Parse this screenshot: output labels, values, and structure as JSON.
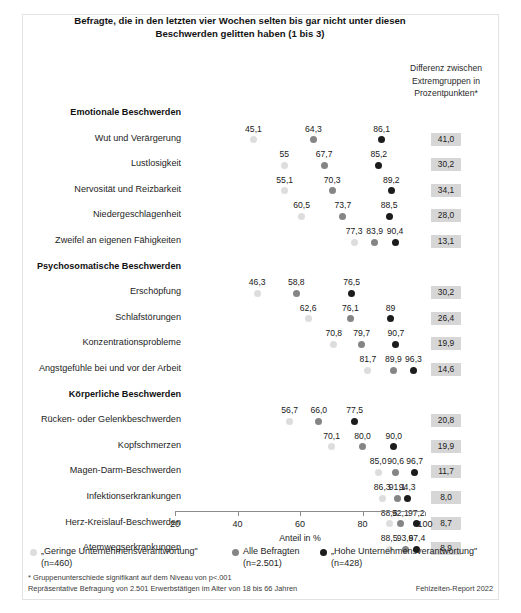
{
  "title": "Befragte, die in den letzten vier Wochen selten bis gar nicht unter diesen Beschwerden gelitten haben (1 bis 3)",
  "diff_column_header": "Differenz zwischen Extremgruppen in Prozentpunkten*",
  "footnotes": {
    "line1": "* Gruppenunterschiede signifikant auf dem Niveau von p<.001",
    "line2": "Repräsentative Befragung von 2.501 Erwerbstätigen im Alter von 18 bis 66 Jahren",
    "source": "Fehlzeiten-Report 2022"
  },
  "legend": {
    "items": [
      {
        "label": "„Geringe Unternehmensverantwortung\"",
        "sub": "(n=460)",
        "color": "#dddddd",
        "class": "low"
      },
      {
        "label": "Alle Befragten",
        "sub": "(n=2.501)",
        "color": "#858585",
        "class": "mid"
      },
      {
        "label": "„Hohe Unternehmensverantwortung\"",
        "sub": "(n=428)",
        "color": "#1c1c1c",
        "class": "high"
      }
    ]
  },
  "chart_data": {
    "type": "scatter",
    "title": "Befragte, die in den letzten vier Wochen selten bis gar nicht unter diesen Beschwerden gelitten haben (1 bis 3)",
    "xlabel": "Anteil in %",
    "ylabel": "",
    "xlim": [
      20,
      100
    ],
    "xticks": [
      20,
      40,
      60,
      80,
      100
    ],
    "grid": false,
    "legend_position": "bottom",
    "series": [
      {
        "name": "„Geringe Unternehmensverantwortung\" (n=460)",
        "color": "#dddddd"
      },
      {
        "name": "Alle Befragten (n=2.501)",
        "color": "#858585"
      },
      {
        "name": "„Hohe Unternehmensverantwortung\" (n=428)",
        "color": "#1c1c1c"
      }
    ],
    "sections": [
      {
        "header": "Emotionale Beschwerden",
        "rows": [
          {
            "label": "Wut und Verärgerung",
            "low": 45.1,
            "mid": 64.3,
            "high": 86.1,
            "low_text": "45,1",
            "mid_text": "64,3",
            "high_text": "86,1",
            "diff": "41,0"
          },
          {
            "label": "Lustlosigkeit",
            "low": 55.0,
            "mid": 67.7,
            "high": 85.2,
            "low_text": "55",
            "mid_text": "67,7",
            "high_text": "85,2",
            "diff": "30,2"
          },
          {
            "label": "Nervosität und Reizbarkeit",
            "low": 55.1,
            "mid": 70.3,
            "high": 89.2,
            "low_text": "55,1",
            "mid_text": "70,3",
            "high_text": "89,2",
            "diff": "34,1"
          },
          {
            "label": "Niedergeschlagenheit",
            "low": 60.5,
            "mid": 73.7,
            "high": 88.5,
            "low_text": "60,5",
            "mid_text": "73,7",
            "high_text": "88,5",
            "diff": "28,0"
          },
          {
            "label": "Zweifel an eigenen Fähigkeiten",
            "low": 77.3,
            "mid": 83.9,
            "high": 90.4,
            "low_text": "77,3",
            "mid_text": "83,9",
            "high_text": "90,4",
            "diff": "13,1"
          }
        ]
      },
      {
        "header": "Psychosomatische Beschwerden",
        "rows": [
          {
            "label": "Erschöpfung",
            "low": 46.3,
            "mid": 58.8,
            "high": 76.5,
            "low_text": "46,3",
            "mid_text": "58,8",
            "high_text": "76,5",
            "diff": "30,2"
          },
          {
            "label": "Schlafstörungen",
            "low": 62.6,
            "mid": 76.1,
            "high": 89.0,
            "low_text": "62,6",
            "mid_text": "76,1",
            "high_text": "89",
            "diff": "26,4"
          },
          {
            "label": "Konzentrationsprobleme",
            "low": 70.8,
            "mid": 79.7,
            "high": 90.7,
            "low_text": "70,8",
            "mid_text": "79,7",
            "high_text": "90,7",
            "diff": "19,9"
          },
          {
            "label": "Angstgefühle bei und vor der Arbeit",
            "low": 81.7,
            "mid": 89.9,
            "high": 96.3,
            "low_text": "81,7",
            "mid_text": "89,9",
            "high_text": "96,3",
            "diff": "14,6"
          }
        ]
      },
      {
        "header": "Körperliche Beschwerden",
        "rows": [
          {
            "label": "Rücken- oder Gelenkbeschwerden",
            "low": 56.7,
            "mid": 66.0,
            "high": 77.5,
            "low_text": "56,7",
            "mid_text": "66,0",
            "high_text": "77,5",
            "diff": "20,8"
          },
          {
            "label": "Kopfschmerzen",
            "low": 70.1,
            "mid": 80.0,
            "high": 90.0,
            "low_text": "70,1",
            "mid_text": "80,0",
            "high_text": "90,0",
            "diff": "19,9"
          },
          {
            "label": "Magen-Darm-Beschwerden",
            "low": 85.0,
            "mid": 90.6,
            "high": 96.7,
            "low_text": "85,0",
            "mid_text": "90,6",
            "high_text": "96,7",
            "diff": "11,7"
          },
          {
            "label": "Infektionserkrankungen",
            "low": 86.3,
            "mid": 91.1,
            "high": 94.3,
            "low_text": "86,3",
            "mid_text": "91,1",
            "high_text": "94,3",
            "diff": "8,0"
          },
          {
            "label": "Herz-Kreislauf-Beschwerden",
            "low": 88.5,
            "mid": 92.1,
            "high": 97.2,
            "low_text": "88,5",
            "mid_text": "92,1",
            "high_text": "97,2",
            "diff": "8,7"
          },
          {
            "label": "Atemwegserkrankungen",
            "low": 88.5,
            "mid": 93.6,
            "high": 97.4,
            "low_text": "88,5",
            "mid_text": "93,6",
            "high_text": "97,4",
            "diff": "8,9"
          }
        ]
      }
    ]
  }
}
